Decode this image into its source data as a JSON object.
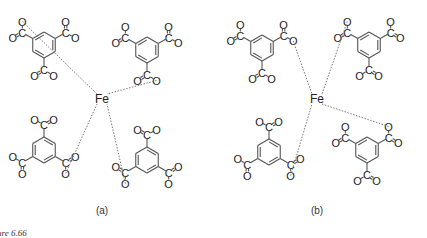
{
  "figure": {
    "caption_fragment": "ure 6.66",
    "panels": [
      {
        "label": "(a)",
        "center_atom": "Fe",
        "ligand": "benzene-1,3,5-tricarboxylate",
        "ligand_count": 4
      },
      {
        "label": "(b)",
        "center_atom": "Fe",
        "ligand": "benzene-1,3,5-tricarboxylate",
        "ligand_count": 4
      }
    ],
    "atoms": {
      "carbon": "C",
      "oxygen": "O",
      "iron": "Fe"
    },
    "colors": {
      "ink": "#222222",
      "bond": "#555555",
      "background": "#ffffff"
    }
  }
}
